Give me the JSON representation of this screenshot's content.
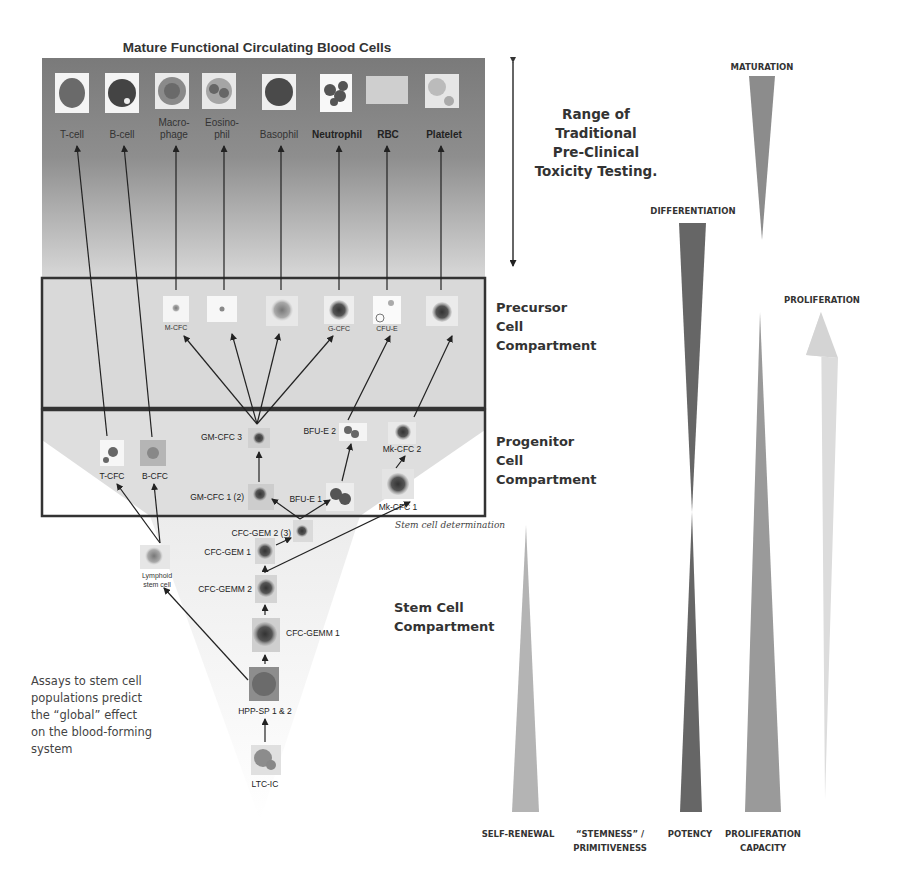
{
  "title": "Mature Functional Circulating Blood Cells",
  "range_label": [
    "Range of",
    "Traditional",
    "Pre-Clinical",
    "Toxicity Testing."
  ],
  "mature_cells": [
    {
      "label": "T-cell",
      "bold": false
    },
    {
      "label": "B-cell",
      "bold": false
    },
    {
      "label_lines": [
        "Macro-",
        "phage"
      ],
      "bold": false
    },
    {
      "label_lines": [
        "Eosino-",
        "phil"
      ],
      "bold": false
    },
    {
      "label": "Basophil",
      "bold": false
    },
    {
      "label": "Neutrophil",
      "bold": true
    },
    {
      "label": "RBC",
      "bold": true
    },
    {
      "label": "Platelet",
      "bold": true
    }
  ],
  "compartments": {
    "precursor": [
      "Precursor",
      "Cell",
      "Compartment"
    ],
    "progenitor": [
      "Progenitor",
      "Cell",
      "Compartment"
    ],
    "stem": [
      "Stem Cell",
      "Compartment"
    ]
  },
  "precursor_cells": [
    "M-CFC",
    "",
    "",
    "G-CFC",
    "CFU-E",
    ""
  ],
  "progenitor_cells": {
    "t_cfc": "T-CFC",
    "b_cfc": "B-CFC",
    "gm_cfc_3": "GM-CFC 3",
    "gm_cfc_1_2": "GM-CFC 1 (2)",
    "bfu_e_2": "BFU-E 2",
    "bfu_e_1": "BFU-E 1",
    "mk_cfc_2": "Mk-CFC 2",
    "mk_cfc_1": "Mk-CFC 1"
  },
  "stem_cells": {
    "cfc_gem_2_3": "CFC-GEM 2 (3)",
    "cfc_gem_1": "CFC-GEM 1",
    "cfc_gemm_2": "CFC-GEMM 2",
    "cfc_gemm_1": "CFC-GEMM 1",
    "hpp_sp": "HPP-SP 1 & 2",
    "ltc_ic": "LTC-IC",
    "lymphoid_stem_cell": [
      "Lymphoid",
      "stem cell"
    ]
  },
  "stem_cell_determination": "Stem cell determination",
  "assay_note": [
    "Assays to stem cell",
    "populations predict",
    "the “global” effect",
    "on the blood-forming",
    "system"
  ],
  "triangles": {
    "maturation": "MATURATION",
    "differentiation": "DIFFERENTIATION",
    "proliferation": "PROLIFERATION",
    "self_renewal": "SELF-RENEWAL",
    "stemness": [
      "“STEMNESS” /",
      "PRIMITIVENESS"
    ],
    "potency": "POTENCY",
    "proliferation_capacity": [
      "PROLIFERATION",
      "CAPACITY"
    ]
  },
  "colors": {
    "mature_bg_top": "#7a7a7a",
    "mature_bg_bottom": "#d6d6d6",
    "compartment_bg": "#d9d9d9",
    "box_border": "#333333",
    "differentiation_fill": "#666666",
    "maturation_fill": "#8c8c8c",
    "proliferation_fill": "#dcdcdc",
    "self_renewal_fill": "#b4b4b4",
    "proliferation_capacity_fill": "#9a9a9a"
  }
}
